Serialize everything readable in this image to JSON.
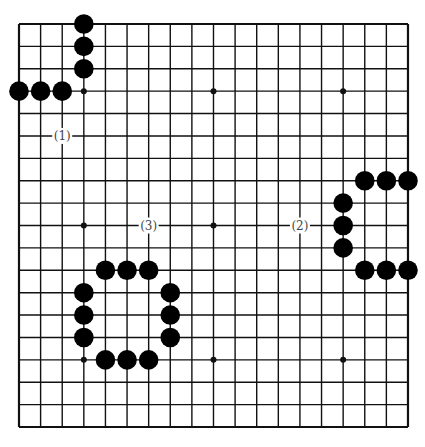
{
  "board": {
    "size": 19,
    "origin_x": 19,
    "origin_y": 24,
    "step_x": 21.61,
    "step_y": 22.39,
    "line_color": "#111111",
    "stone_color": "#000000",
    "background": "#ffffff"
  },
  "hoshi": [
    [
      3,
      3
    ],
    [
      9,
      3
    ],
    [
      15,
      3
    ],
    [
      3,
      9
    ],
    [
      9,
      9
    ],
    [
      15,
      9
    ],
    [
      3,
      15
    ],
    [
      9,
      15
    ],
    [
      15,
      15
    ]
  ],
  "groups": [
    {
      "label": "(1)",
      "label_pos": [
        2,
        5
      ],
      "stones": [
        [
          3,
          0
        ],
        [
          3,
          1
        ],
        [
          3,
          2
        ],
        [
          0,
          3
        ],
        [
          1,
          3
        ],
        [
          2,
          3
        ]
      ]
    },
    {
      "label": "(2)",
      "label_pos": [
        13,
        9
      ],
      "stones": [
        [
          16,
          7
        ],
        [
          17,
          7
        ],
        [
          18,
          7
        ],
        [
          15,
          8
        ],
        [
          15,
          9
        ],
        [
          15,
          10
        ],
        [
          16,
          11
        ],
        [
          17,
          11
        ],
        [
          18,
          11
        ]
      ]
    },
    {
      "label": "(3)",
      "label_pos": [
        6,
        9
      ],
      "stones": [
        [
          4,
          11
        ],
        [
          5,
          11
        ],
        [
          6,
          11
        ],
        [
          3,
          12
        ],
        [
          3,
          13
        ],
        [
          3,
          14
        ],
        [
          7,
          12
        ],
        [
          7,
          13
        ],
        [
          7,
          14
        ],
        [
          4,
          15
        ],
        [
          5,
          15
        ],
        [
          6,
          15
        ]
      ]
    }
  ]
}
